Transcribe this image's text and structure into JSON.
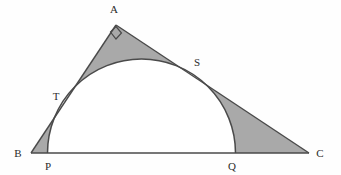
{
  "figure": {
    "background_color": "#fefefe",
    "stroke_color": "#4a4a4a",
    "shade_color": "#a9a9a9",
    "label_color": "#2b2b2b",
    "stroke_width": 1.4
  },
  "points": {
    "A": {
      "label": "A",
      "x": 116,
      "y": 25,
      "label_x": 114,
      "label_y": 12
    },
    "B": {
      "label": "B",
      "x": 31,
      "y": 153,
      "label_x": 18,
      "label_y": 157
    },
    "C": {
      "label": "C",
      "x": 309,
      "y": 153,
      "label_x": 318,
      "label_y": 157
    },
    "P": {
      "label": "P",
      "x": 50,
      "y": 153,
      "label_x": 47,
      "label_y": 168
    },
    "Q": {
      "label": "Q",
      "x": 233,
      "y": 153,
      "label_x": 229,
      "label_y": 168
    },
    "T": {
      "label": "T",
      "x": 68,
      "y": 90,
      "label_x": 55,
      "label_y": 99
    },
    "S": {
      "label": "S",
      "x": 193,
      "y": 71,
      "label_x": 194,
      "label_y": 66
    }
  },
  "semicircle": {
    "center_x": 141.5,
    "center_y": 153,
    "radius": 94,
    "baseline_y": 153
  },
  "right_angle": {
    "at": "A",
    "size": 9,
    "marker_points": "110,31 116,26 122,33 116,39"
  },
  "segments": [
    {
      "name": "side-AB",
      "from": "A",
      "to": "B"
    },
    {
      "name": "side-AC",
      "from": "A",
      "to": "C"
    },
    {
      "name": "side-BC",
      "from": "B",
      "to": "C"
    }
  ],
  "shaded_regions": [
    {
      "name": "region-A-top",
      "description": "area between vertex A and arc, bounded by AT and AS"
    },
    {
      "name": "region-B-left",
      "description": "area between vertex B, P and arc up to T"
    },
    {
      "name": "region-C-right",
      "description": "area between vertex C, Q and arc up to S"
    }
  ],
  "labels_order": [
    "A",
    "S",
    "T",
    "B",
    "P",
    "Q",
    "C"
  ]
}
